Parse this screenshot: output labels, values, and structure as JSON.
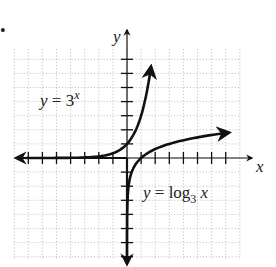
{
  "figure": {
    "bullet": "•",
    "x_axis_label": "x",
    "y_axis_label": "y",
    "labels": {
      "exp": {
        "y": "y",
        "eq": " = 3",
        "sup": "x"
      },
      "log": {
        "y": "y",
        "eq": " = log",
        "sub": "3",
        "x": " x"
      }
    }
  },
  "chart_data": {
    "type": "line",
    "title": "",
    "xlabel": "x",
    "ylabel": "y",
    "xlim": [
      -8,
      8
    ],
    "ylim": [
      -7,
      7
    ],
    "grid": true,
    "grid_style": "dotted",
    "x_ticks": [
      -7,
      -6,
      -5,
      -4,
      -3,
      -2,
      -1,
      1,
      2,
      3,
      4,
      5,
      6,
      7
    ],
    "y_ticks": [
      -7,
      -6,
      -5,
      -4,
      -3,
      -2,
      -1,
      1,
      2,
      3,
      4,
      5,
      6,
      7
    ],
    "tick_labels_shown": false,
    "series": [
      {
        "name": "y = 3^x",
        "function": "3^x",
        "x": [
          -7,
          -4,
          -3,
          -2,
          -1,
          0,
          0.5,
          1,
          1.5,
          1.77
        ],
        "y": [
          0.0005,
          0.012,
          0.037,
          0.111,
          0.333,
          1,
          1.732,
          3,
          5.196,
          7
        ]
      },
      {
        "name": "y = log_3 x",
        "function": "log_3(x)",
        "x": [
          0.0005,
          0.012,
          0.037,
          0.111,
          0.333,
          1,
          1.732,
          3,
          5.196,
          7.5
        ],
        "y": [
          -7,
          -4,
          -3,
          -2,
          -1,
          0,
          0.5,
          1,
          1.5,
          1.83
        ]
      }
    ],
    "annotations": [
      {
        "text": "y = 3^x",
        "position": [
          -6.5,
          3
        ]
      },
      {
        "text": "y = log_3 x",
        "position": [
          1,
          -2
        ]
      }
    ]
  }
}
